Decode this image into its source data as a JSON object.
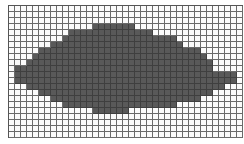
{
  "figure": {
    "grid": {
      "cols": 39,
      "rows": 22,
      "cell_px": 6
    },
    "colors": {
      "filled": "#595959",
      "empty": "#fbfbfb",
      "line": "#6a6a6a"
    },
    "filled_rows": [
      {
        "row": 3,
        "from": 14,
        "to": 20
      },
      {
        "row": 4,
        "from": 10,
        "to": 23
      },
      {
        "row": 5,
        "from": 9,
        "to": 27
      },
      {
        "row": 6,
        "from": 7,
        "to": 28
      },
      {
        "row": 7,
        "from": 5,
        "to": 31
      },
      {
        "row": 8,
        "from": 4,
        "to": 32
      },
      {
        "row": 9,
        "from": 3,
        "to": 33
      },
      {
        "row": 10,
        "from": 1,
        "to": 33
      },
      {
        "row": 11,
        "from": 1,
        "to": 37
      },
      {
        "row": 12,
        "from": 1,
        "to": 37
      },
      {
        "row": 13,
        "from": 3,
        "to": 35
      },
      {
        "row": 14,
        "from": 5,
        "to": 33
      },
      {
        "row": 15,
        "from": 7,
        "to": 31
      },
      {
        "row": 16,
        "from": 9,
        "to": 27
      },
      {
        "row": 17,
        "from": 14,
        "to": 19
      }
    ]
  }
}
